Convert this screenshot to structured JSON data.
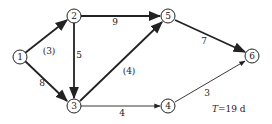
{
  "diagram": {
    "type": "activity-on-arrow network",
    "nodes": [
      {
        "id": "1",
        "label": "1",
        "x": 20,
        "y": 57
      },
      {
        "id": "2",
        "label": "2",
        "x": 74,
        "y": 16
      },
      {
        "id": "3",
        "label": "3",
        "x": 74,
        "y": 106
      },
      {
        "id": "4",
        "label": "4",
        "x": 168,
        "y": 106
      },
      {
        "id": "5",
        "label": "5",
        "x": 168,
        "y": 16
      },
      {
        "id": "6",
        "label": "6",
        "x": 252,
        "y": 56
      }
    ],
    "edges": [
      {
        "from": "1",
        "to": "2",
        "label": "(3)",
        "critical": true
      },
      {
        "from": "1",
        "to": "3",
        "label": "8",
        "critical": true
      },
      {
        "from": "2",
        "to": "3",
        "label": "5",
        "critical": true
      },
      {
        "from": "2",
        "to": "5",
        "label": "9",
        "critical": true
      },
      {
        "from": "3",
        "to": "5",
        "label": "(4)",
        "critical": true
      },
      {
        "from": "3",
        "to": "4",
        "label": "4",
        "critical": false
      },
      {
        "from": "5",
        "to": "6",
        "label": "7",
        "critical": true
      },
      {
        "from": "4",
        "to": "6",
        "label": "3",
        "critical": false
      }
    ],
    "note": {
      "symbol": "T",
      "text": "=19 d"
    }
  }
}
